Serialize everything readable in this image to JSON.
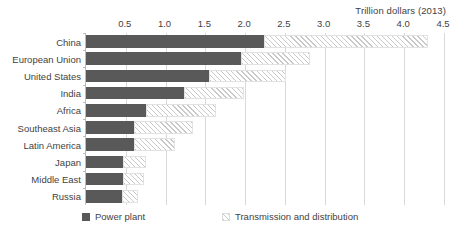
{
  "axis_caption": "Trillion dollars (2013)",
  "legend": {
    "items": [
      {
        "label": "Power plant",
        "swatch": "solid-dark-square-icon",
        "color": "#595959"
      },
      {
        "label": "Transmission and distribution",
        "swatch": "hatched-square-icon",
        "color": "#c9c9c9"
      }
    ]
  },
  "chart_data": {
    "type": "bar",
    "orientation": "horizontal",
    "stacked": true,
    "title": "",
    "subtitle": "",
    "xlabel": "Trillion dollars (2013)",
    "ylabel": "",
    "xlim": [
      0,
      4.5
    ],
    "xticks": [
      0.5,
      1.0,
      1.5,
      2.0,
      2.5,
      3.0,
      3.5,
      4.0,
      4.5
    ],
    "xticklabels": [
      "0.5",
      "1.0",
      "1.5",
      "2.0",
      "2.5",
      "3.0",
      "3.5",
      "4.0",
      "4.5"
    ],
    "grid": true,
    "grid_axis": "x",
    "legend_position": "bottom",
    "categories": [
      "China",
      "European Union",
      "United States",
      "India",
      "Africa",
      "Southeast Asia",
      "Latin America",
      "Japan",
      "Middle East",
      "Russia"
    ],
    "series": [
      {
        "name": "Power plant",
        "color": "#595959",
        "values": [
          2.24,
          1.95,
          1.54,
          1.23,
          0.76,
          0.6,
          0.6,
          0.47,
          0.47,
          0.45
        ]
      },
      {
        "name": "Transmission and distribution",
        "color": "#c9c9c9",
        "values": [
          2.06,
          0.87,
          0.98,
          0.76,
          0.87,
          0.75,
          0.52,
          0.29,
          0.26,
          0.2
        ]
      }
    ],
    "totals": [
      4.3,
      2.82,
      2.52,
      1.99,
      1.63,
      1.35,
      1.12,
      0.76,
      0.73,
      0.65
    ]
  }
}
